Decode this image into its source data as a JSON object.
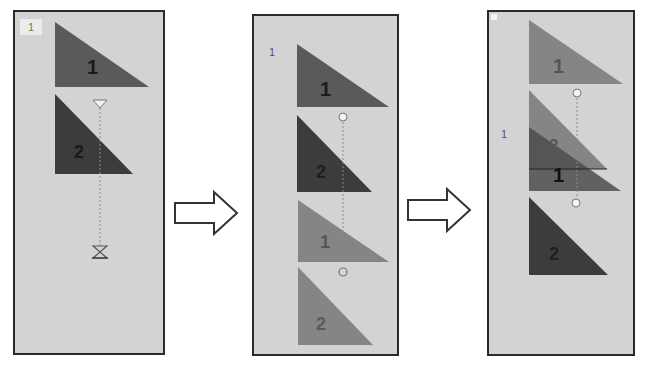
{
  "panels": [
    {
      "id": "step-1",
      "page_label": "1",
      "shapes": [
        {
          "label": "1",
          "shade": "dark-gray"
        },
        {
          "label": "2",
          "shade": "darker-gray"
        }
      ],
      "connector": {
        "start": "triangle-marker",
        "end": "hourglass-marker"
      }
    },
    {
      "id": "step-2",
      "page_label": "1",
      "shapes": [
        {
          "label": "1",
          "shade": "dark-gray"
        },
        {
          "label": "2",
          "shade": "darker-gray"
        },
        {
          "label": "1",
          "shade": "light-gray"
        },
        {
          "label": "2",
          "shade": "light-gray"
        }
      ],
      "connector": {
        "start": "circle-marker",
        "end": "circle-marker"
      }
    },
    {
      "id": "step-3",
      "page_label": "1",
      "shapes": [
        {
          "label": "1",
          "shade": "light-gray"
        },
        {
          "label": "2",
          "shade": "light-gray"
        },
        {
          "label": "1",
          "shade": "dark-gray"
        },
        {
          "label": "2",
          "shade": "darker-gray"
        }
      ],
      "connector": {
        "start": "circle-marker",
        "end": "circle-marker"
      }
    }
  ],
  "arrows": [
    {
      "icon": "right-arrow-icon"
    },
    {
      "icon": "right-arrow-icon"
    }
  ],
  "colors": {
    "panel_bg": "#d3d3d3",
    "panel_border": "#2a2a2a",
    "dark": "#5a5a5a",
    "darker": "#3c3c3c",
    "light": "#838383",
    "connector": "#8a8a8a",
    "marker_stroke": "#777777"
  }
}
